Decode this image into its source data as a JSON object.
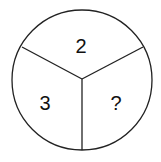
{
  "diagram": {
    "shape": "circle divided into three sectors",
    "sectors": [
      {
        "position": "top",
        "label": "2"
      },
      {
        "position": "bottom-left",
        "label": "3"
      },
      {
        "position": "bottom-right",
        "label": "?"
      }
    ],
    "stroke_color": "#222222",
    "background": "#ffffff"
  }
}
